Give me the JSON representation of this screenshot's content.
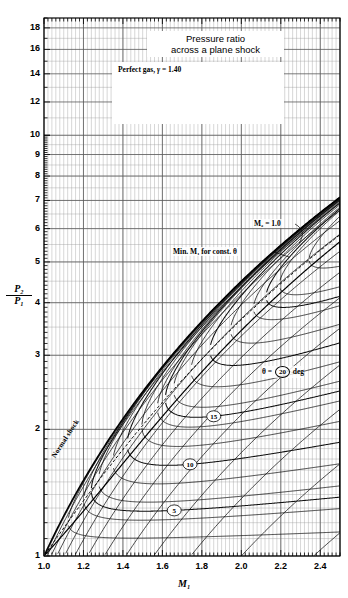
{
  "title": {
    "line1": "Pressure ratio",
    "line2": "across a plane shock"
  },
  "gas_note": {
    "text": "Perfect gas,",
    "symbol": "γ",
    "equals": "= 1.40",
    "upstream_label": "M₁, p₁",
    "downstream_label": "M₂, p₂",
    "angle_label": "θ"
  },
  "annotations": {
    "m2_sonic": "M₂ = 1.0",
    "min_mach": "Min. M₁ for const. θ",
    "normal_shock": "Normal shock",
    "theta_legend_prefix": "θ =",
    "theta_legend_value": "20",
    "theta_legend_suffix": "deg"
  },
  "axes": {
    "x_label": "M₁",
    "y_label_num": "P₂",
    "y_label_den": "P₁",
    "x_ticks": [
      "1.0",
      "1.2",
      "1.4",
      "1.6",
      "1.8",
      "2.0",
      "2.2",
      "2.4"
    ],
    "x_tick_values": [
      1.0,
      1.2,
      1.4,
      1.6,
      1.8,
      2.0,
      2.2,
      2.4
    ],
    "y_ticks": [
      "1",
      "2",
      "3",
      "4",
      "5",
      "6",
      "7",
      "8",
      "9",
      "10",
      "12",
      "14",
      "16",
      "18"
    ],
    "y_tick_values": [
      1,
      2,
      3,
      4,
      5,
      6,
      7,
      8,
      9,
      10,
      12,
      14,
      16,
      18
    ]
  },
  "chart_data": {
    "type": "line",
    "title": "Pressure ratio across a plane shock",
    "xlabel": "M1",
    "ylabel": "P2/P1",
    "xscale": "linear",
    "yscale": "log",
    "xlim": [
      1.0,
      2.5
    ],
    "ylim": [
      1.0,
      19.0
    ],
    "grid": true,
    "legend_position": "inline-labels",
    "gamma": 1.4,
    "labeled_theta_contours": [
      5,
      10,
      15,
      20,
      25
    ],
    "theta_contours_deg": [
      2,
      4,
      5,
      6,
      8,
      10,
      12,
      14,
      15,
      16,
      18,
      20,
      22,
      24,
      25,
      26,
      28,
      30,
      32,
      34
    ],
    "beta_contours_deg": [
      25,
      30,
      35,
      40,
      45,
      50,
      55,
      60,
      65,
      70,
      75,
      80,
      85
    ],
    "normal_shock_curve": {
      "name": "Normal shock (theta = 0, beta = 90)",
      "x": [
        1.0,
        1.1,
        1.2,
        1.3,
        1.4,
        1.5,
        1.6,
        1.8,
        2.0,
        2.2,
        2.4,
        2.5
      ],
      "y": [
        1.0,
        1.245,
        1.513,
        1.805,
        2.12,
        2.458,
        2.82,
        3.613,
        4.5,
        5.48,
        6.553,
        7.125
      ]
    },
    "m2_sonic_curve": {
      "name": "M2 = 1.0 locus",
      "x": [
        1.0,
        1.2,
        1.4,
        1.6,
        1.8,
        2.0,
        2.2,
        2.4,
        2.5
      ],
      "y": [
        1.0,
        1.44,
        2.0,
        2.66,
        3.42,
        4.28,
        5.24,
        6.3,
        6.86
      ]
    },
    "min_mach_curve": {
      "name": "Min. M1 for const. theta (max deflection locus)",
      "x": [
        1.0,
        1.2,
        1.4,
        1.6,
        1.8,
        2.0,
        2.2,
        2.4,
        2.5
      ],
      "y": [
        1.0,
        1.42,
        1.96,
        2.6,
        3.34,
        4.18,
        5.12,
        6.16,
        6.71
      ]
    }
  }
}
